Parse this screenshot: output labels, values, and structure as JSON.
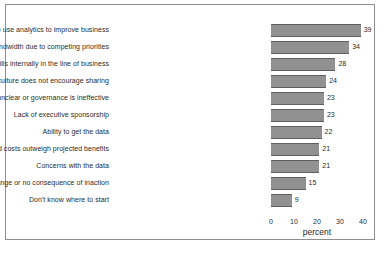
{
  "chart_data": {
    "type": "bar",
    "orientation": "horizontal",
    "title": "",
    "xlabel": "percent",
    "ylabel": "",
    "xlim": [
      0,
      40
    ],
    "xticks": [
      0,
      10,
      20,
      30,
      40
    ],
    "grid": false,
    "legend": null,
    "bar_color": "#919191",
    "bar_edge_color": "#5f5f5f",
    "text_color": "#2b2b2b",
    "frame_color": "#8e8e8e",
    "background": "#ffffff",
    "categories": [
      "Lack of understanding of how to use analytics to improve business",
      "Lack of management bandwidth due to competing priorities",
      "Lack of skills internally in the line of business",
      "Existing culture does not encourage sharing",
      "Ownership of data is unclear or governance is ineffective",
      "Lack of executive sponsorship",
      "Ability to get the data",
      "Perceived costs outweigh projected benefits",
      "Concerns with the data",
      "No case for change or no consequence of inaction",
      "Don't know where to start"
    ],
    "values": [
      39,
      34,
      28,
      24,
      23,
      23,
      22,
      21,
      21,
      15,
      9
    ],
    "value_labels": [
      "39",
      "34",
      "28",
      "24",
      "23",
      "23",
      "22",
      "21",
      "21",
      "15",
      "9"
    ],
    "xtick_labels": [
      "0",
      "10",
      "20",
      "30",
      "40"
    ]
  }
}
